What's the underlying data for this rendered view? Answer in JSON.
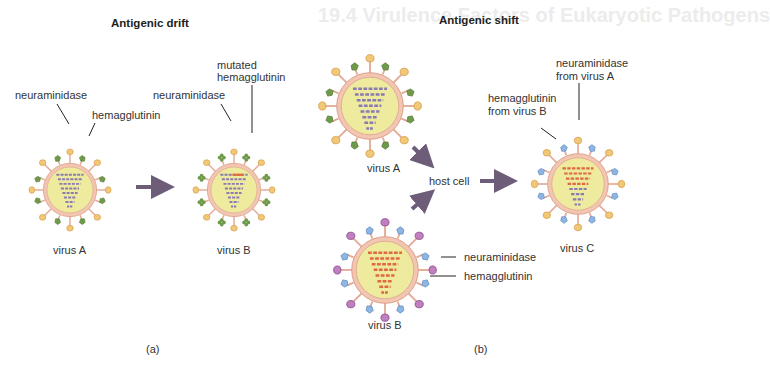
{
  "background_ghost_text": "19.4 Virulence Factors of Eukaryotic Pathogens",
  "panel_a": {
    "title": "Antigenic drift",
    "caption": "(a)",
    "virus_a": {
      "label": "virus A",
      "neuraminidase_label": "neuraminidase",
      "hemagglutinin_label": "hemagglutinin"
    },
    "virus_b": {
      "label": "virus B",
      "neuraminidase_label": "neuraminidase",
      "mutated_line1": "mutated",
      "mutated_line2": "hemagglutinin"
    }
  },
  "panel_b": {
    "title": "Antigenic shift",
    "caption": "(b)",
    "virus_a": {
      "label": "virus A"
    },
    "virus_b": {
      "label": "virus B",
      "neuraminidase_label": "neuraminidase",
      "hemagglutinin_label": "hemagglutinin"
    },
    "host_cell": "host cell",
    "virus_c": {
      "label": "virus C",
      "na_line1": "neuraminidase",
      "na_line2": "from virus A",
      "ha_line1": "hemagglutinin",
      "ha_line2": "from virus B"
    }
  },
  "colors": {
    "capsule_fill": "#eeeb9e",
    "capsule_ring": "#f2c6b2",
    "capsule_stroke": "#d9967e",
    "spike_tan": "#e9b863",
    "ha_green": "#6e9a4a",
    "ha_blue": "#7ba7d9",
    "na_purple": "#b576b7",
    "rna_purple": "#8a7bb0",
    "rna_red": "#e06a3e",
    "arrow": "#6d5d78"
  }
}
